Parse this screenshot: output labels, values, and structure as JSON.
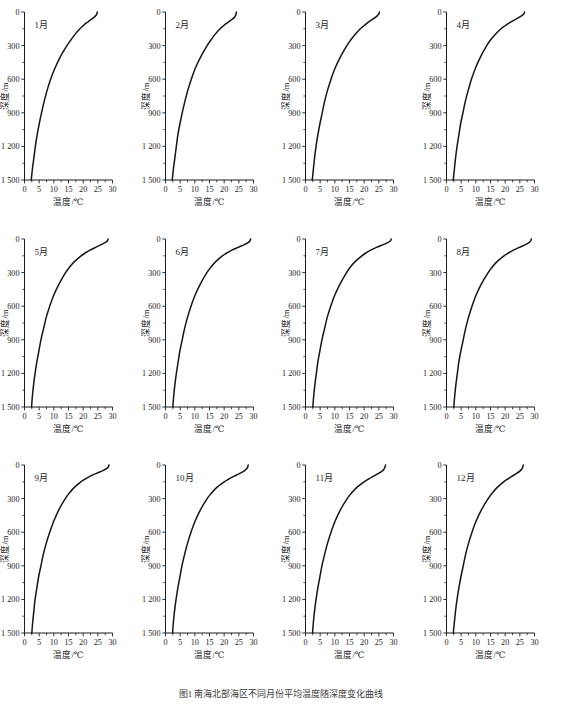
{
  "figure": {
    "caption": "图1  南海北部海区不同月份平均温度随深度变化曲线",
    "y_axis_title": "深度/m",
    "x_axis_title": "温度/℃",
    "y_ticks": [
      "0",
      "300",
      "600",
      "900",
      "1 200",
      "1 500"
    ],
    "x_ticks": [
      "0",
      "5",
      "10",
      "15",
      "20",
      "25",
      "30"
    ]
  },
  "chart_data": {
    "type": "line",
    "title": "南海北部海区不同月份平均温度随深度变化曲线",
    "xlabel": "温度/℃",
    "ylabel": "深度/m",
    "xlim": [
      0,
      30
    ],
    "ylim": [
      1500,
      0
    ],
    "y_inverted": true,
    "grid": false,
    "legend": "none",
    "x_tick_values": [
      0,
      5,
      10,
      15,
      20,
      25,
      30
    ],
    "x_minor_step": 2.5,
    "y_tick_values": [
      0,
      300,
      600,
      900,
      1200,
      1500
    ],
    "y_tick_labels": [
      "0",
      "300",
      "600",
      "900",
      "1 200",
      "1 500"
    ],
    "depths": [
      0,
      10,
      20,
      30,
      50,
      75,
      100,
      125,
      150,
      200,
      250,
      300,
      400,
      500,
      600,
      700,
      800,
      900,
      1000,
      1100,
      1200,
      1300,
      1400,
      1500
    ],
    "series": [
      {
        "name": "1月",
        "panel": 1,
        "surface_temp": 24.8,
        "bottom_temp": 2.3,
        "values": [
          24.8,
          24.7,
          24.6,
          24.4,
          23.6,
          22.3,
          21.0,
          19.9,
          18.9,
          17.2,
          15.8,
          14.5,
          12.2,
          10.4,
          8.9,
          7.7,
          6.7,
          5.8,
          5.0,
          4.3,
          3.7,
          3.2,
          2.7,
          2.3
        ]
      },
      {
        "name": "2月",
        "panel": 2,
        "surface_temp": 24.2,
        "bottom_temp": 2.3,
        "values": [
          24.2,
          24.1,
          24.0,
          23.9,
          23.4,
          22.2,
          20.9,
          19.7,
          18.6,
          16.9,
          15.5,
          14.2,
          12.0,
          10.2,
          8.8,
          7.6,
          6.6,
          5.7,
          4.9,
          4.2,
          3.7,
          3.2,
          2.7,
          2.3
        ]
      },
      {
        "name": "3月",
        "panel": 3,
        "surface_temp": 25.2,
        "bottom_temp": 2.3,
        "values": [
          25.2,
          25.1,
          24.9,
          24.6,
          23.7,
          22.3,
          21.0,
          19.8,
          18.7,
          16.9,
          15.4,
          14.1,
          11.9,
          10.1,
          8.7,
          7.5,
          6.5,
          5.7,
          4.9,
          4.2,
          3.6,
          3.1,
          2.7,
          2.3
        ]
      },
      {
        "name": "4月",
        "panel": 4,
        "surface_temp": 26.6,
        "bottom_temp": 2.3,
        "values": [
          26.6,
          26.5,
          26.2,
          25.8,
          24.6,
          22.9,
          21.3,
          19.9,
          18.6,
          16.6,
          15.0,
          13.7,
          11.6,
          9.9,
          8.5,
          7.4,
          6.4,
          5.6,
          4.8,
          4.2,
          3.6,
          3.1,
          2.7,
          2.3
        ]
      },
      {
        "name": "5月",
        "panel": 5,
        "surface_temp": 28.5,
        "bottom_temp": 2.4,
        "values": [
          28.5,
          28.4,
          28.1,
          27.6,
          26.2,
          24.2,
          22.3,
          20.7,
          19.3,
          17.1,
          15.4,
          14.0,
          11.8,
          10.0,
          8.6,
          7.4,
          6.5,
          5.6,
          4.9,
          4.2,
          3.6,
          3.1,
          2.7,
          2.4
        ]
      },
      {
        "name": "6月",
        "panel": 6,
        "surface_temp": 29.0,
        "bottom_temp": 2.5,
        "values": [
          29.0,
          28.9,
          28.7,
          28.3,
          26.9,
          24.7,
          22.6,
          20.9,
          19.4,
          17.2,
          15.5,
          14.1,
          11.9,
          10.1,
          8.7,
          7.5,
          6.5,
          5.7,
          4.9,
          4.3,
          3.7,
          3.2,
          2.8,
          2.5
        ]
      },
      {
        "name": "7月",
        "panel": 7,
        "surface_temp": 29.2,
        "bottom_temp": 2.5,
        "values": [
          29.2,
          29.1,
          28.8,
          28.2,
          26.5,
          24.2,
          22.2,
          20.6,
          19.2,
          17.0,
          15.3,
          14.0,
          11.8,
          10.0,
          8.6,
          7.4,
          6.5,
          5.6,
          4.9,
          4.2,
          3.7,
          3.2,
          2.8,
          2.5
        ]
      },
      {
        "name": "8月",
        "panel": 8,
        "surface_temp": 28.9,
        "bottom_temp": 2.5,
        "values": [
          28.9,
          28.8,
          28.6,
          28.2,
          26.9,
          24.8,
          22.8,
          21.1,
          19.6,
          17.3,
          15.6,
          14.2,
          11.9,
          10.1,
          8.7,
          7.5,
          6.5,
          5.7,
          4.9,
          4.2,
          3.7,
          3.2,
          2.8,
          2.5
        ]
      },
      {
        "name": "9月",
        "panel": 9,
        "surface_temp": 28.8,
        "bottom_temp": 2.5,
        "values": [
          28.8,
          28.7,
          28.5,
          28.1,
          26.7,
          24.5,
          22.4,
          20.7,
          19.2,
          17.0,
          15.3,
          13.9,
          11.7,
          10.0,
          8.6,
          7.4,
          6.4,
          5.6,
          4.8,
          4.2,
          3.6,
          3.2,
          2.8,
          2.5
        ]
      },
      {
        "name": "10月",
        "panel": 10,
        "surface_temp": 28.2,
        "bottom_temp": 2.4,
        "values": [
          28.2,
          28.1,
          28.0,
          27.8,
          27.0,
          25.3,
          23.4,
          21.6,
          20.0,
          17.5,
          15.7,
          14.2,
          11.9,
          10.1,
          8.7,
          7.5,
          6.5,
          5.6,
          4.9,
          4.2,
          3.6,
          3.1,
          2.7,
          2.4
        ]
      },
      {
        "name": "11月",
        "panel": 11,
        "surface_temp": 27.3,
        "bottom_temp": 2.4,
        "values": [
          27.3,
          27.2,
          27.1,
          26.9,
          26.3,
          24.9,
          23.2,
          21.5,
          20.0,
          17.5,
          15.7,
          14.2,
          11.9,
          10.1,
          8.7,
          7.5,
          6.5,
          5.6,
          4.9,
          4.2,
          3.6,
          3.1,
          2.7,
          2.4
        ]
      },
      {
        "name": "12月",
        "panel": 12,
        "surface_temp": 26.2,
        "bottom_temp": 2.3,
        "values": [
          26.2,
          26.1,
          26.0,
          25.8,
          25.2,
          23.9,
          22.4,
          20.9,
          19.5,
          17.3,
          15.6,
          14.2,
          11.9,
          10.1,
          8.7,
          7.5,
          6.5,
          5.7,
          4.9,
          4.2,
          3.6,
          3.1,
          2.7,
          2.3
        ]
      }
    ]
  }
}
